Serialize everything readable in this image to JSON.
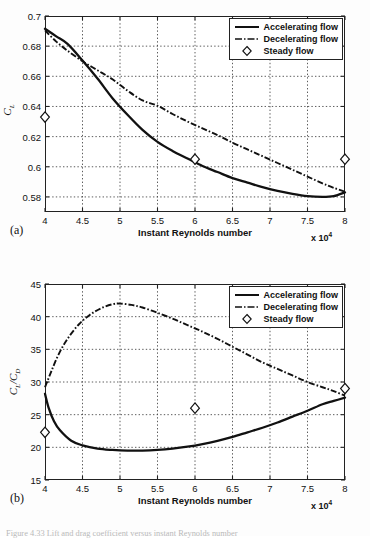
{
  "figure": {
    "panel_a_tag": "(a)",
    "panel_b_tag": "(b)",
    "caption": "Figure 4.33  Lift and drag coefficient versus instant Reynolds number"
  },
  "legend": {
    "accelerating": "Accelerating flow",
    "decelerating": "Decelerating flow",
    "steady": "Steady flow"
  },
  "axis": {
    "xlabel": "Instant Reynolds number",
    "xmultiplier": "x 10",
    "xmultiplier_exp": "4",
    "ylabel_a": "C",
    "ylabel_a_sub": "L",
    "ylabel_b_num": "C",
    "ylabel_b_num_sub": "L",
    "ylabel_b_sep": "/",
    "ylabel_b_den": "C",
    "ylabel_b_den_sub": "D"
  },
  "chart_data": [
    {
      "type": "line",
      "panel": "(a)",
      "title": "",
      "xlabel": "Instant Reynolds number",
      "ylabel": "C_L",
      "xlim": [
        4,
        8
      ],
      "ylim": [
        0.57,
        0.7
      ],
      "xticks": [
        4,
        4.5,
        5,
        5.5,
        6,
        6.5,
        7,
        7.5,
        8
      ],
      "xticklabels": [
        "4",
        "4.5",
        "5",
        "5.5",
        "6",
        "6.5",
        "7",
        "7.5",
        "8"
      ],
      "yticks": [
        0.58,
        0.6,
        0.62,
        0.64,
        0.66,
        0.68,
        0.7
      ],
      "yticklabels": [
        "0.58",
        "0.6",
        "0.62",
        "0.64",
        "0.66",
        "0.68",
        "0.7"
      ],
      "x_multiplier": "x 10^4",
      "grid": true,
      "legend_position": "upper right",
      "series": [
        {
          "name": "Accelerating flow",
          "style": "solid",
          "x": [
            4.0,
            4.15,
            4.3,
            4.5,
            4.7,
            4.9,
            5.1,
            5.3,
            5.5,
            5.7,
            5.9,
            6.1,
            6.3,
            6.5,
            6.7,
            6.9,
            7.1,
            7.3,
            7.5,
            7.7,
            7.85,
            8.0
          ],
          "values": [
            0.6915,
            0.6865,
            0.6815,
            0.6705,
            0.6585,
            0.6455,
            0.6345,
            0.6245,
            0.6165,
            0.6105,
            0.6055,
            0.6005,
            0.5965,
            0.5925,
            0.5895,
            0.5865,
            0.584,
            0.582,
            0.5805,
            0.58,
            0.5805,
            0.583
          ]
        },
        {
          "name": "Decelerating flow",
          "style": "dashdot",
          "x": [
            4.0,
            4.15,
            4.3,
            4.5,
            4.7,
            4.9,
            5.1,
            5.3,
            5.5,
            5.7,
            5.9,
            6.1,
            6.3,
            6.5,
            6.7,
            6.9,
            7.1,
            7.3,
            7.5,
            7.7,
            7.85,
            8.0
          ],
          "values": [
            0.6905,
            0.683,
            0.677,
            0.67,
            0.664,
            0.658,
            0.6505,
            0.644,
            0.6405,
            0.635,
            0.63,
            0.6255,
            0.621,
            0.616,
            0.6115,
            0.607,
            0.6025,
            0.598,
            0.5935,
            0.589,
            0.586,
            0.5835
          ]
        },
        {
          "name": "Steady flow",
          "style": "diamond",
          "x": [
            4.0,
            6.0,
            8.0
          ],
          "values": [
            0.633,
            0.605,
            0.605
          ]
        }
      ]
    },
    {
      "type": "line",
      "panel": "(b)",
      "title": "",
      "xlabel": "Instant Reynolds number",
      "ylabel": "C_L/C_D",
      "xlim": [
        4,
        8
      ],
      "ylim": [
        15,
        45
      ],
      "xticks": [
        4,
        4.5,
        5,
        5.5,
        6,
        6.5,
        7,
        7.5,
        8
      ],
      "xticklabels": [
        "4",
        "4.5",
        "5",
        "5.5",
        "6",
        "6.5",
        "7",
        "7.5",
        "8"
      ],
      "yticks": [
        15,
        20,
        25,
        30,
        35,
        40,
        45
      ],
      "yticklabels": [
        "15",
        "20",
        "25",
        "30",
        "35",
        "40",
        "45"
      ],
      "x_multiplier": "x 10^4",
      "grid": true,
      "legend_position": "upper right",
      "series": [
        {
          "name": "Accelerating flow",
          "style": "solid",
          "x": [
            4.0,
            4.05,
            4.12,
            4.2,
            4.35,
            4.5,
            4.7,
            4.9,
            5.1,
            5.3,
            5.5,
            5.7,
            5.9,
            6.1,
            6.3,
            6.5,
            6.7,
            6.9,
            7.1,
            7.3,
            7.5,
            7.7,
            7.85,
            8.0
          ],
          "values": [
            28.2,
            26.0,
            24.0,
            22.6,
            21.0,
            20.3,
            19.8,
            19.6,
            19.5,
            19.5,
            19.6,
            19.8,
            20.1,
            20.5,
            21.0,
            21.6,
            22.3,
            23.0,
            23.8,
            24.7,
            25.6,
            26.6,
            27.1,
            27.6
          ]
        },
        {
          "name": "Decelerating flow",
          "style": "dashdot",
          "x": [
            4.0,
            4.08,
            4.18,
            4.3,
            4.45,
            4.6,
            4.75,
            4.9,
            5.0,
            5.15,
            5.3,
            5.5,
            5.7,
            5.9,
            6.1,
            6.3,
            6.5,
            6.7,
            6.9,
            7.1,
            7.3,
            7.5,
            7.7,
            7.85,
            8.0
          ],
          "values": [
            29.2,
            31.5,
            34.2,
            36.6,
            38.8,
            40.3,
            41.3,
            41.9,
            42.0,
            41.8,
            41.4,
            40.6,
            39.7,
            38.7,
            37.7,
            36.6,
            35.4,
            34.2,
            33.0,
            32.0,
            31.0,
            30.0,
            29.2,
            28.6,
            27.9
          ]
        },
        {
          "name": "Steady flow",
          "style": "diamond",
          "x": [
            4.0,
            6.0,
            8.0
          ],
          "values": [
            22.3,
            26.0,
            29.0
          ]
        }
      ]
    }
  ]
}
